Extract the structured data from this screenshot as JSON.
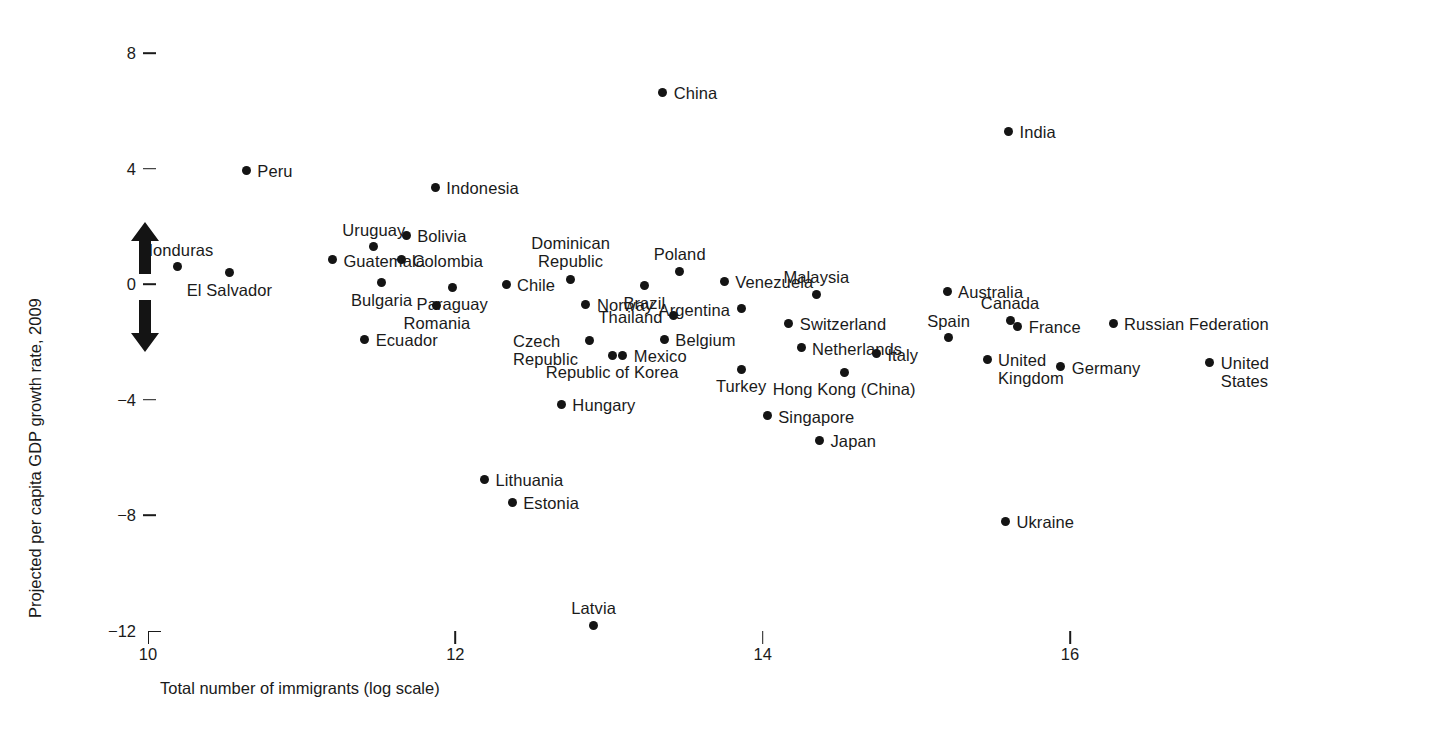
{
  "chart_data": {
    "type": "scatter",
    "title": "",
    "xlabel": "Total number of immigrants (log scale)",
    "ylabel": "Projected per capita GDP growth rate, 2009",
    "xlim": [
      9.6,
      17.0
    ],
    "ylim": [
      -12.8,
      8.8
    ],
    "xticks": [
      "10",
      "12",
      "14",
      "16"
    ],
    "xtick_values": [
      10,
      12,
      14,
      16
    ],
    "yticks": [
      "8",
      "4",
      "0",
      "-4",
      "-8",
      "-12"
    ],
    "ytick_values": [
      8,
      4,
      0,
      -4,
      -8,
      -12
    ],
    "grid": false,
    "legend": null,
    "annotations": [
      {
        "name": "up-arrow",
        "meaning": "growth increasing"
      },
      {
        "name": "down-arrow",
        "meaning": "growth decreasing"
      }
    ],
    "marker_color": "#141414",
    "points": [
      {
        "label": "China",
        "x": 13.35,
        "y": 6.65,
        "pos": "right"
      },
      {
        "label": "India",
        "x": 15.6,
        "y": 5.3,
        "pos": "right"
      },
      {
        "label": "Peru",
        "x": 10.64,
        "y": 3.95,
        "pos": "right"
      },
      {
        "label": "Indonesia",
        "x": 11.87,
        "y": 3.35,
        "pos": "right"
      },
      {
        "label": "Bolivia",
        "x": 11.68,
        "y": 1.7,
        "pos": "right"
      },
      {
        "label": "Uruguay",
        "x": 11.47,
        "y": 1.3,
        "pos": "above"
      },
      {
        "label": "Colombia",
        "x": 11.65,
        "y": 0.85,
        "pos": "right"
      },
      {
        "label": "Guatemala",
        "x": 11.2,
        "y": 0.85,
        "pos": "right"
      },
      {
        "label": "Honduras",
        "x": 10.19,
        "y": 0.6,
        "pos": "above"
      },
      {
        "label": "El Salvador",
        "x": 10.53,
        "y": 0.4,
        "pos": "below"
      },
      {
        "label": "Bulgaria",
        "x": 11.52,
        "y": 0.05,
        "pos": "below"
      },
      {
        "label": "Paraguay",
        "x": 11.98,
        "y": -0.1,
        "pos": "below"
      },
      {
        "label": "Chile",
        "x": 12.33,
        "y": 0.0,
        "pos": "right"
      },
      {
        "label": "Dominican Republic",
        "x": 12.75,
        "y": 0.15,
        "pos": "above"
      },
      {
        "label": "Poland",
        "x": 13.46,
        "y": 0.45,
        "pos": "above"
      },
      {
        "label": "Venezuela",
        "x": 13.75,
        "y": 0.1,
        "pos": "right"
      },
      {
        "label": "Malaysia",
        "x": 14.35,
        "y": -0.35,
        "pos": "above"
      },
      {
        "label": "Australia",
        "x": 15.2,
        "y": -0.25,
        "pos": "right"
      },
      {
        "label": "Brazil",
        "x": 13.23,
        "y": -0.05,
        "pos": "below"
      },
      {
        "label": "Norway",
        "x": 12.85,
        "y": -0.7,
        "pos": "right"
      },
      {
        "label": "Argentina",
        "x": 13.86,
        "y": -0.85,
        "pos": "left"
      },
      {
        "label": "Romania",
        "x": 11.88,
        "y": -0.75,
        "pos": "below"
      },
      {
        "label": "Thailand",
        "x": 13.42,
        "y": -1.1,
        "pos": "left"
      },
      {
        "label": "Switzerland",
        "x": 14.17,
        "y": -1.35,
        "pos": "right"
      },
      {
        "label": "Canada",
        "x": 15.61,
        "y": -1.25,
        "pos": "above"
      },
      {
        "label": "France",
        "x": 15.66,
        "y": -1.45,
        "pos": "right"
      },
      {
        "label": "Spain",
        "x": 15.21,
        "y": -1.85,
        "pos": "above"
      },
      {
        "label": "Russian Federation",
        "x": 16.28,
        "y": -1.35,
        "pos": "right"
      },
      {
        "label": "Ecuador",
        "x": 11.41,
        "y": -1.9,
        "pos": "right"
      },
      {
        "label": "Czech Republic",
        "x": 12.87,
        "y": -1.95,
        "pos": "left"
      },
      {
        "label": "Belgium",
        "x": 13.36,
        "y": -1.9,
        "pos": "right"
      },
      {
        "label": "Netherlands",
        "x": 14.25,
        "y": -2.2,
        "pos": "right"
      },
      {
        "label": "Italy",
        "x": 14.74,
        "y": -2.4,
        "pos": "right"
      },
      {
        "label": "United Kingdom",
        "x": 15.46,
        "y": -2.6,
        "pos": "right"
      },
      {
        "label": "Germany",
        "x": 15.94,
        "y": -2.85,
        "pos": "right"
      },
      {
        "label": "United States",
        "x": 16.91,
        "y": -2.7,
        "pos": "right"
      },
      {
        "label": "Mexico",
        "x": 13.09,
        "y": -2.45,
        "pos": "right"
      },
      {
        "label": "Republic of Korea",
        "x": 13.02,
        "y": -2.45,
        "pos": "below"
      },
      {
        "label": "Turkey",
        "x": 13.86,
        "y": -2.95,
        "pos": "below"
      },
      {
        "label": "Hong Kong (China)",
        "x": 14.53,
        "y": -3.05,
        "pos": "below"
      },
      {
        "label": "Hungary",
        "x": 12.69,
        "y": -4.15,
        "pos": "right"
      },
      {
        "label": "Singapore",
        "x": 14.03,
        "y": -4.55,
        "pos": "right"
      },
      {
        "label": "Japan",
        "x": 14.37,
        "y": -5.4,
        "pos": "right"
      },
      {
        "label": "Lithuania",
        "x": 12.19,
        "y": -6.75,
        "pos": "right"
      },
      {
        "label": "Estonia",
        "x": 12.37,
        "y": -7.55,
        "pos": "right"
      },
      {
        "label": "Ukraine",
        "x": 15.58,
        "y": -8.2,
        "pos": "right"
      },
      {
        "label": "Latvia",
        "x": 12.9,
        "y": -11.8,
        "pos": "above"
      }
    ]
  }
}
